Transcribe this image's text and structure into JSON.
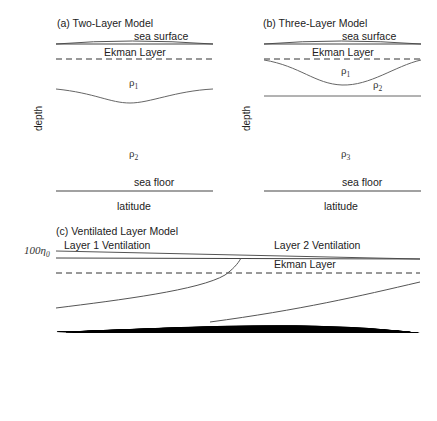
{
  "panels": {
    "a": {
      "title": "(a) Two-Layer Model",
      "sea_surface": "sea surface",
      "ekman": "Ekman Layer",
      "rho1": "ρ",
      "rho1_sub": "1",
      "rho2": "ρ",
      "rho2_sub": "2",
      "sea_floor": "sea floor",
      "xlabel": "latitude",
      "ylabel": "depth"
    },
    "b": {
      "title": "(b) Three-Layer Model",
      "sea_surface": "sea surface",
      "ekman": "Ekman Layer",
      "rho1": "ρ",
      "rho1_sub": "1",
      "rho2": "ρ",
      "rho2_sub": "2",
      "rho3": "ρ",
      "rho3_sub": "3",
      "sea_floor": "sea floor",
      "xlabel": "latitude",
      "ylabel": "depth"
    },
    "c": {
      "title": "(c) Ventilated Layer Model",
      "layer1_vent": "Layer 1 Ventilation",
      "layer2_vent": "Layer 2 Ventilation",
      "ekman": "Ekman Layer",
      "eta0_prefix": "100",
      "eta0": "η",
      "eta0_sub": "0",
      "eta1": "η",
      "eta1_sub": "1",
      "eta2": "η",
      "eta2_sub": "2",
      "eta3": "η",
      "eta3_sub": "3",
      "h1": "h",
      "h1_sub": "1",
      "h2": "h",
      "h2_sub": "2",
      "h3": "h",
      "h3_sub": "3",
      "rho1": "ρ",
      "rho1_sub": "1",
      "rho2": "ρ",
      "rho2_sub": "2",
      "rho3": "ρ",
      "rho3_sub": "3",
      "rho4": "ρ",
      "rho4_sub": "4",
      "subducted_1": "Subducted",
      "subducted_2": "Subducted",
      "motionless": "motionless",
      "xlabel": "latitude",
      "ylabel": "depth"
    }
  },
  "colors": {
    "line": "#555555",
    "light_arrow": "#bbbbbb",
    "dark_arrow": "#555555",
    "text": "#222222"
  }
}
